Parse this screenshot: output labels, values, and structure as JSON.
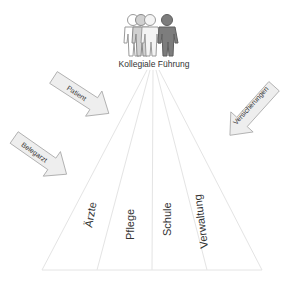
{
  "title": "Kollegiale Führung",
  "people_icon": "group-of-people-icon",
  "arrows": [
    {
      "label": "Patient",
      "direction": "down-right"
    },
    {
      "label": "Belegarzt",
      "direction": "down-right"
    },
    {
      "label": "Versicherungen",
      "direction": "down-left"
    }
  ],
  "segments": [
    {
      "label": "Ärzte"
    },
    {
      "label": "Pflege"
    },
    {
      "label": "Schule"
    },
    {
      "label": "Verwaltung"
    }
  ],
  "colors": {
    "fan_lines": "#e6e6e6",
    "arrow_fill": "#eeeeee",
    "arrow_stroke": "#a8a8a8",
    "person_light": "#ffffff",
    "person_mid": "#c8c8c8",
    "person_dark": "#7a7a7a",
    "text": "#333333"
  }
}
